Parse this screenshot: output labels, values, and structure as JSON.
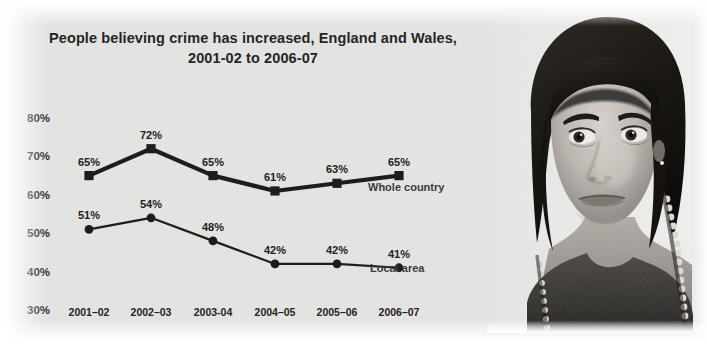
{
  "title": {
    "line1": "People believing crime has increased, England and Wales,",
    "line2": "2001-02 to 2006-07"
  },
  "colors": {
    "background": "#e3e3e2",
    "ink": "#262626",
    "series_whole_country": "#1d1d1d",
    "series_local_area": "#1d1d1d"
  },
  "photo": {
    "caption": "black-and-white portrait photograph of a young woman"
  },
  "chart_data": {
    "type": "line",
    "title": "People believing crime has increased, England and Wales, 2001-02 to 2006-07",
    "xlabel": "",
    "ylabel": "",
    "categories": [
      "2001–02",
      "2002–03",
      "2003-04",
      "2004–05",
      "2005–06",
      "2006–07"
    ],
    "ylim": [
      30,
      80
    ],
    "yticks": [
      "30%",
      "40%",
      "50%",
      "60%",
      "70%",
      "80%"
    ],
    "ytick_values": [
      30,
      40,
      50,
      60,
      70,
      80
    ],
    "grid": false,
    "legend_position": "inline-right",
    "series": [
      {
        "name": "Whole country",
        "marker": "square",
        "values": [
          65,
          72,
          65,
          61,
          63,
          65
        ],
        "labels": [
          "65%",
          "72%",
          "65%",
          "61%",
          "63%",
          "65%"
        ]
      },
      {
        "name": "Local area",
        "marker": "circle",
        "values": [
          51,
          54,
          48,
          42,
          42,
          41
        ],
        "labels": [
          "51%",
          "54%",
          "48%",
          "42%",
          "42%",
          "41%"
        ]
      }
    ]
  }
}
